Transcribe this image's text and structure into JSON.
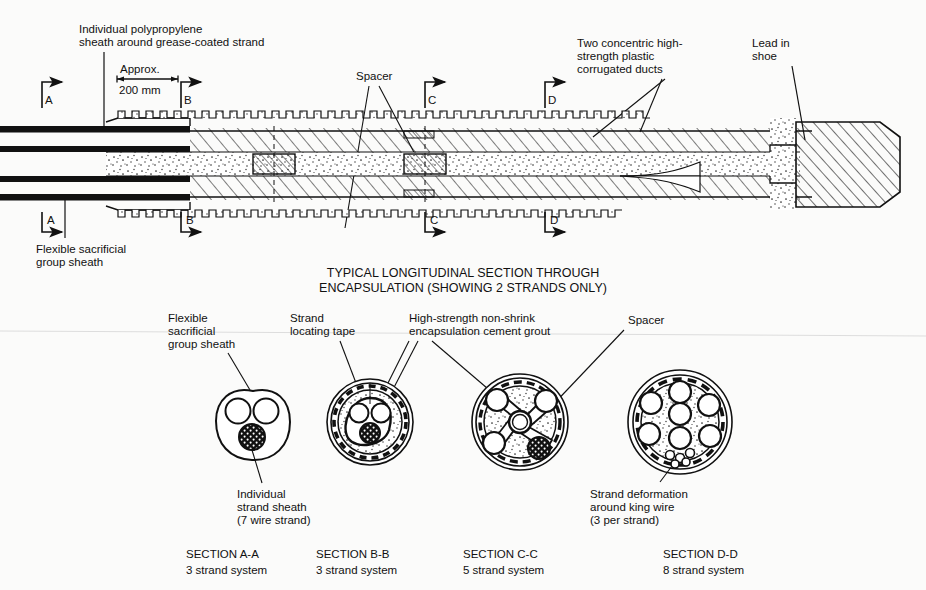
{
  "figure": {
    "caption_line1": "TYPICAL LONGITUDINAL SECTION THROUGH",
    "caption_line2": "ENCAPSULATION (SHOWING 2 STRANDS ONLY)"
  },
  "top_labels": {
    "polypropylene_l1": "Individual polypropylene",
    "polypropylene_l2": "sheath around grease-coated strand",
    "approx": "Approx.",
    "dimension": "200 mm",
    "spacer": "Spacer",
    "ducts_l1": "Two concentric high-",
    "ducts_l2": "strength plastic",
    "ducts_l3": "corrugated ducts",
    "shoe_l1": "Lead in",
    "shoe_l2": "shoe",
    "sheath_l1": "Flexible sacrificial",
    "sheath_l2": "group sheath"
  },
  "section_marks": {
    "a": "A",
    "b": "B",
    "c": "C",
    "d": "D"
  },
  "lower_labels": {
    "flexible_l1": "Flexible",
    "flexible_l2": "sacrificial",
    "flexible_l3": "group sheath",
    "tape_l1": "Strand",
    "tape_l2": "locating tape",
    "grout_l1": "High-strength non-shrink",
    "grout_l2": "encapsulation cement grout",
    "spacer": "Spacer",
    "individual_l1": "Individual",
    "individual_l2": "strand sheath",
    "individual_l3": "(7 wire strand)",
    "deformation_l1": "Strand deformation",
    "deformation_l2": "around king wire",
    "deformation_l3": "(3 per strand)"
  },
  "sections": [
    {
      "id": "A-A",
      "title": "SECTION A-A",
      "subtitle": "3 strand system",
      "strand_count": 3
    },
    {
      "id": "B-B",
      "title": "SECTION B-B",
      "subtitle": "3 strand system",
      "strand_count": 3
    },
    {
      "id": "C-C",
      "title": "SECTION C-C",
      "subtitle": "5 strand system",
      "strand_count": 5
    },
    {
      "id": "D-D",
      "title": "SECTION D-D",
      "subtitle": "8 strand system",
      "strand_count": 8
    }
  ],
  "colors": {
    "ink": "#111111",
    "paper": "#fbfbfa",
    "stipple": "#2a2a2a"
  }
}
